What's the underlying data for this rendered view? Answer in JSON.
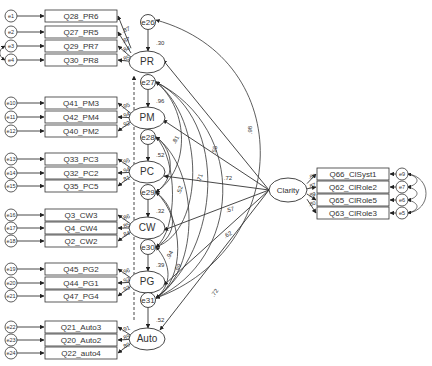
{
  "diagram": {
    "title": "",
    "latents": [
      {
        "id": "PR",
        "label": "PR",
        "disturbance": "e26",
        "disturbance_weight": ".30",
        "indicators": [
          {
            "label": "Q28_PR6",
            "error": "e1",
            "loading": ".87"
          },
          {
            "label": "Q27_PR5",
            "error": "e2",
            "loading": ".87"
          },
          {
            "label": "Q29_PR7",
            "error": "e3",
            "loading": ".84"
          },
          {
            "label": "Q30_PR8",
            "error": "e4",
            "loading": ".85"
          }
        ]
      },
      {
        "id": "PM",
        "label": "PM",
        "disturbance": "e27",
        "disturbance_weight": ".96",
        "indicators": [
          {
            "label": "Q41_PM3",
            "error": "e10",
            "loading": ".95"
          },
          {
            "label": "Q42_PM4",
            "error": "e11",
            "loading": ".94"
          },
          {
            "label": "Q40_PM2",
            "error": "e12",
            "loading": ".92"
          }
        ]
      },
      {
        "id": "PC",
        "label": "PC",
        "disturbance": "e28",
        "disturbance_weight": ".52",
        "indicators": [
          {
            "label": "Q33_PC3",
            "error": "e13",
            "loading": ".95"
          },
          {
            "label": "Q32_PC2",
            "error": "e14",
            "loading": ".94"
          },
          {
            "label": "Q35_PC5",
            "error": "e15",
            "loading": ".81"
          }
        ]
      },
      {
        "id": "CW",
        "label": "CW",
        "disturbance": "e29",
        "disturbance_weight": ".32",
        "indicators": [
          {
            "label": "Q3_CW3",
            "error": "e16",
            "loading": ".86"
          },
          {
            "label": "Q4_CW4",
            "error": "e17",
            "loading": ".85"
          },
          {
            "label": "Q2_CW2",
            "error": "e18",
            "loading": ".84"
          }
        ]
      },
      {
        "id": "PG",
        "label": "PG",
        "disturbance": "e30",
        "disturbance_weight": ".39",
        "indicators": [
          {
            "label": "Q45_PG2",
            "error": "e19",
            "loading": ".96"
          },
          {
            "label": "Q44_PG1",
            "error": "e20",
            "loading": ".92"
          },
          {
            "label": "Q47_PG4",
            "error": "e21",
            "loading": ".93"
          }
        ]
      },
      {
        "id": "Auto",
        "label": "Auto",
        "disturbance": "e31",
        "disturbance_weight": ".52",
        "indicators": [
          {
            "label": "Q21_Auto3",
            "error": "e22",
            "loading": ".91"
          },
          {
            "label": "Q20_Auto2",
            "error": "e23",
            "loading": ".89"
          },
          {
            "label": "Q22_auto4",
            "error": "e24",
            "loading": ".80"
          }
        ]
      }
    ],
    "exogenous": {
      "id": "Clarity",
      "label": "Clarity",
      "indicators": [
        {
          "label": "Q66_ClSyst1",
          "error": "e9",
          "loading": ".88"
        },
        {
          "label": "Q62_ClRole2",
          "error": "e7",
          "loading": ".87"
        },
        {
          "label": "Q65_ClRole5",
          "error": "e6",
          "loading": ".89"
        },
        {
          "label": "Q63_ClRole3",
          "error": "e5",
          "loading": ".80"
        }
      ]
    },
    "structural_paths": [
      {
        "from": "Clarity",
        "to": "PR",
        "weight": ".55"
      },
      {
        "from": "Clarity",
        "to": "PM",
        "weight": ".98"
      },
      {
        "from": "Clarity",
        "to": "PC",
        "weight": ".72"
      },
      {
        "from": "Clarity",
        "to": "CW",
        "weight": ".57"
      },
      {
        "from": "Clarity",
        "to": "PG",
        "weight": ".62"
      },
      {
        "from": "Clarity",
        "to": "Auto",
        "weight": ".72"
      }
    ],
    "curve_labels": [
      ".98",
      ".55",
      ".71",
      ".81",
      ".94",
      ".52",
      ".69"
    ]
  }
}
